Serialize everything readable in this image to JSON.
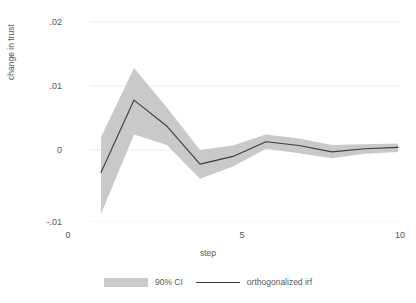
{
  "chart_data": {
    "type": "line",
    "title": "",
    "subtitle": "",
    "xlabel": "step",
    "ylabel": "change in trust",
    "x": [
      1,
      2,
      3,
      4,
      5,
      6,
      7,
      8,
      9,
      10
    ],
    "xlim": [
      0,
      10
    ],
    "ylim": [
      -0.01,
      0.02
    ],
    "xticks": [
      0,
      5,
      10
    ],
    "xtick_labels": [
      "0",
      "5",
      "10"
    ],
    "yticks": [
      -0.01,
      0,
      0.01,
      0.02
    ],
    "ytick_labels": [
      "-.01",
      "0",
      ".01",
      ".02"
    ],
    "grid": true,
    "grid_axis": "y",
    "legend_position": "bottom",
    "series": [
      {
        "name": "orthogonalized irf",
        "kind": "line",
        "color": "#3c3c3c",
        "values": [
          -0.0035,
          0.0078,
          0.0037,
          -0.0022,
          -0.001,
          0.0013,
          0.0007,
          -0.0003,
          0.0002,
          0.0004
        ]
      },
      {
        "name": "90% CI",
        "kind": "band",
        "color": "#c9c9c9",
        "upper": [
          0.002,
          0.0128,
          0.0066,
          0.0,
          0.0007,
          0.0024,
          0.0018,
          0.0008,
          0.0009,
          0.001
        ],
        "lower": [
          -0.01,
          0.0024,
          0.0008,
          -0.0045,
          -0.0026,
          0.0002,
          -0.0005,
          -0.0013,
          -0.0006,
          -0.0003
        ]
      }
    ],
    "colors": {
      "band": "#c9c9c9",
      "line": "#3c3c3c",
      "grid": "#ececec",
      "text": "#58585a",
      "background": "#ffffff"
    }
  },
  "axes": {
    "y_title": "change in trust",
    "x_title": "step",
    "y_tick_labels": [
      "-.01",
      "0",
      ".01",
      ".02"
    ],
    "x_tick_labels": [
      "0",
      "5",
      "10"
    ]
  },
  "legend": {
    "entries": [
      {
        "label": "90% CI",
        "marker": "band-swatch"
      },
      {
        "label": "orthogonalized irf",
        "marker": "line-swatch"
      }
    ]
  }
}
